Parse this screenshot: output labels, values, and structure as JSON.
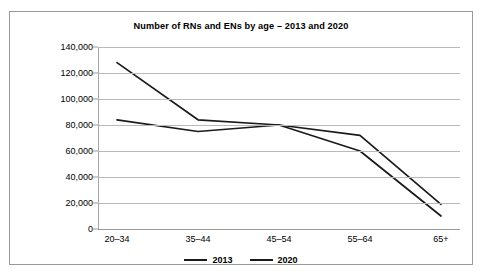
{
  "chart_data": {
    "type": "line",
    "title": "Number of RNs and ENs by age – 2013 and 2020",
    "xlabel": "",
    "ylabel": "",
    "categories": [
      "20–34",
      "35–44",
      "45–54",
      "55–64",
      "65+"
    ],
    "series": [
      {
        "name": "2013",
        "values": [
          128000,
          84000,
          80000,
          60000,
          10000
        ],
        "color": "#1a1a1a"
      },
      {
        "name": "2020",
        "values": [
          84000,
          75000,
          80000,
          72000,
          19000
        ],
        "color": "#1a1a1a"
      }
    ],
    "ylim": [
      0,
      140000
    ],
    "yticks": [
      0,
      20000,
      40000,
      60000,
      80000,
      100000,
      120000,
      140000
    ],
    "ytick_labels": [
      "0",
      "20,000",
      "40,000",
      "60,000",
      "80,000",
      "100,000",
      "120,000",
      "140,000"
    ],
    "grid": true,
    "legend_position": "bottom",
    "legend_entries": [
      "2013",
      "2020"
    ]
  }
}
